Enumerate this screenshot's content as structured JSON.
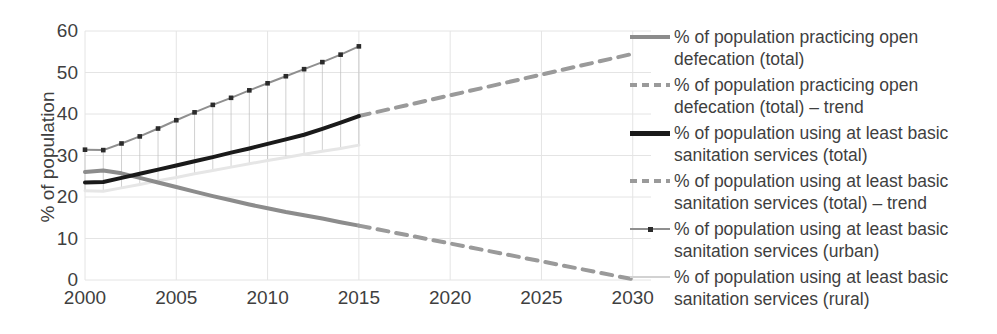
{
  "chart_data": {
    "type": "line",
    "title": "",
    "xlabel": "",
    "ylabel": "% of population",
    "xlim": [
      2000,
      2031
    ],
    "ylim": [
      0,
      60
    ],
    "yticks": [
      0,
      10,
      20,
      30,
      40,
      50,
      60
    ],
    "xticks": [
      2000,
      2005,
      2010,
      2015,
      2020,
      2025,
      2030
    ],
    "grid": true,
    "legend_position": "right",
    "series": [
      {
        "name": "% of population practicing open defecation (total)",
        "style": "solid",
        "color": "#8c8c8c",
        "width": 4,
        "marker": "none",
        "x": [
          2000,
          2001,
          2002,
          2003,
          2004,
          2005,
          2006,
          2007,
          2008,
          2009,
          2010,
          2011,
          2012,
          2013,
          2014,
          2015
        ],
        "values": [
          26.0,
          26.4,
          25.7,
          24.6,
          23.5,
          22.4,
          21.3,
          20.2,
          19.2,
          18.2,
          17.3,
          16.4,
          15.6,
          14.8,
          13.9,
          13.1
        ]
      },
      {
        "name": "% of population practicing open defecation (total) – trend",
        "style": "dashed",
        "color": "#9a9a9a",
        "width": 4,
        "marker": "none",
        "x": [
          2015,
          2030
        ],
        "values": [
          13.1,
          0.2
        ]
      },
      {
        "name": "% of population using at least basic sanitation services (total)",
        "style": "solid",
        "color": "#1a1a1a",
        "width": 4,
        "marker": "none",
        "x": [
          2000,
          2001,
          2002,
          2003,
          2004,
          2005,
          2006,
          2007,
          2008,
          2009,
          2010,
          2011,
          2012,
          2013,
          2014,
          2015
        ],
        "values": [
          23.5,
          23.6,
          24.6,
          25.6,
          26.6,
          27.6,
          28.6,
          29.6,
          30.7,
          31.7,
          32.8,
          33.9,
          35.0,
          36.4,
          37.9,
          39.5
        ]
      },
      {
        "name": "% of population using at least basic sanitation services (total) – trend",
        "style": "dashed",
        "color": "#9a9a9a",
        "width": 4,
        "marker": "none",
        "x": [
          2015,
          2030
        ],
        "values": [
          39.5,
          54.5
        ]
      },
      {
        "name": "% of population using at least basic sanitation services (urban)",
        "style": "solid",
        "color": "#8f8f8f",
        "width": 2,
        "marker": "square",
        "x": [
          2000,
          2001,
          2002,
          2003,
          2004,
          2005,
          2006,
          2007,
          2008,
          2009,
          2010,
          2011,
          2012,
          2013,
          2014,
          2015
        ],
        "values": [
          31.4,
          31.3,
          32.9,
          34.6,
          36.5,
          38.5,
          40.4,
          42.2,
          43.9,
          45.7,
          47.4,
          49.1,
          50.8,
          52.5,
          54.3,
          56.3
        ]
      },
      {
        "name": "% of population using at least basic sanitation services (rural)",
        "style": "solid",
        "color": "#e6e6e6",
        "width": 3,
        "marker": "none",
        "x": [
          2000,
          2001,
          2002,
          2003,
          2004,
          2005,
          2006,
          2007,
          2008,
          2009,
          2010,
          2011,
          2012,
          2013,
          2014,
          2015
        ],
        "values": [
          21.5,
          21.4,
          22.2,
          23.0,
          23.9,
          24.7,
          25.6,
          26.4,
          27.2,
          28.0,
          28.8,
          29.5,
          30.3,
          31.0,
          31.7,
          32.5
        ]
      }
    ]
  },
  "axes": {
    "y_title": "% of population",
    "y_tick_labels": [
      "60",
      "50",
      "40",
      "30",
      "20",
      "10",
      "0"
    ],
    "x_tick_labels": [
      "2000",
      "2005",
      "2010",
      "2015",
      "2020",
      "2025",
      "2030"
    ]
  },
  "legend": {
    "items": [
      {
        "label": "% of population practicing open defecation (total)",
        "swatch": "solid-gray-line-icon"
      },
      {
        "label": "% of population practicing open defecation (total) – trend",
        "swatch": "dashed-gray-line-icon"
      },
      {
        "label": "% of population using at least basic sanitation services (total)",
        "swatch": "solid-black-line-icon"
      },
      {
        "label": "% of population using at least basic sanitation services (total) – trend",
        "swatch": "dashed-gray-line-icon"
      },
      {
        "label": "% of population using at least basic sanitation services (urban)",
        "swatch": "gray-line-with-square-marker-icon"
      },
      {
        "label": "% of population using at least basic sanitation services (rural)",
        "swatch": "light-gray-line-icon"
      }
    ]
  },
  "colors": {
    "open_defecation": "#8c8c8c",
    "trend": "#9a9a9a",
    "total_sanitation": "#1a1a1a",
    "urban_sanitation": "#8f8f8f",
    "rural_sanitation": "#e6e6e6",
    "grid": "#e4e4e4",
    "text": "#3f3f3f",
    "background": "#ffffff"
  }
}
